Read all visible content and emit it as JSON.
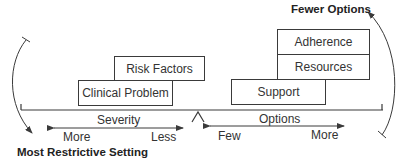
{
  "diagram": {
    "type": "balance-scale",
    "left_side": {
      "boxes": [
        {
          "label": "Risk Factors"
        },
        {
          "label": "Clinical Problem"
        }
      ],
      "axis": {
        "title": "Severity",
        "left_label": "More",
        "right_label": "Less"
      },
      "curved_arrow_label": "Most Restrictive Setting"
    },
    "right_side": {
      "boxes": [
        {
          "label": "Adherence"
        },
        {
          "label": "Resources"
        },
        {
          "label": "Support"
        }
      ],
      "axis": {
        "title": "Options",
        "left_label": "Few",
        "right_label": "More"
      },
      "curved_arrow_label": "Fewer Options"
    },
    "colors": {
      "line": "#3a3a3a",
      "text": "#333333",
      "background": "#ffffff"
    }
  }
}
